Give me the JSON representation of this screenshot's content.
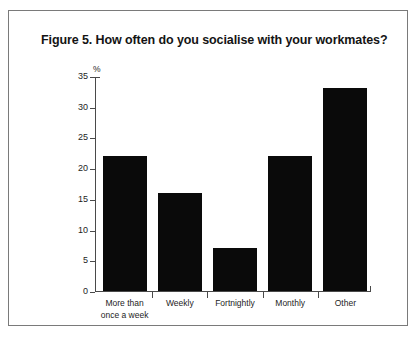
{
  "figure": {
    "title": "Figure 5. How often do you socialise with your workmates?",
    "unit_label": "%"
  },
  "chart_data": {
    "type": "bar",
    "title": "Figure 5. How often do you socialise with your workmates?",
    "categories": [
      "More than\nonce a week",
      "Weekly",
      "Fortnightly",
      "Monthly",
      "Other"
    ],
    "category_labels_flat": [
      "More than once a week",
      "Weekly",
      "Fortnightly",
      "Monthly",
      "Other"
    ],
    "values": [
      22,
      16,
      7,
      22,
      33
    ],
    "xlabel": "",
    "ylabel": "%",
    "ylim": [
      0,
      35
    ],
    "yticks": [
      0,
      5,
      10,
      15,
      20,
      25,
      30,
      35
    ],
    "ytick_labels": [
      "0",
      "5",
      "10",
      "15",
      "20",
      "25",
      "30",
      "35"
    ],
    "grid": false,
    "legend": false,
    "bar_color": "#0a0a0a",
    "background": "#ffffff"
  }
}
